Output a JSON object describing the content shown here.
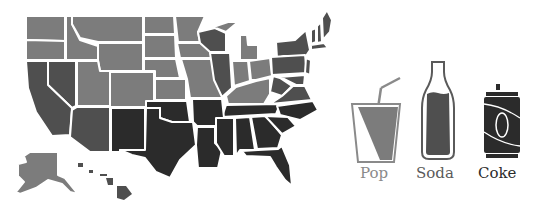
{
  "map": {
    "type": "choropleth",
    "subject": "Soft drink terminology by US state",
    "colors": {
      "pop": "#7c7c7c",
      "soda": "#4f4f4f",
      "coke": "#2b2b2b",
      "border": "#ffffff"
    }
  },
  "legend": {
    "items": [
      {
        "key": "pop",
        "label": "Pop",
        "icon": "cup-with-straw-icon",
        "color": "#7c7c7c",
        "label_color": "#8a8a8a"
      },
      {
        "key": "soda",
        "label": "Soda",
        "icon": "bottle-icon",
        "color": "#4f4f4f",
        "label_color": "#5a5a5a"
      },
      {
        "key": "coke",
        "label": "Coke",
        "icon": "can-icon",
        "color": "#2b2b2b",
        "label_color": "#2b2b2b"
      }
    ]
  }
}
